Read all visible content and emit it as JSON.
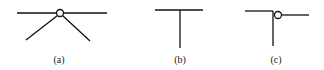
{
  "figures": [
    {
      "id": "a",
      "label": "(a)",
      "description": "horizontal line with hinge circle at center and two diagonal legs"
    },
    {
      "id": "b",
      "label": "(b)",
      "description": "T-junction: horizontal line with vertical stem"
    },
    {
      "id": "c",
      "label": "(c)",
      "description": "corner junction with hinge circle connecting to offset horizontal line"
    }
  ],
  "colors": {
    "stroke": "#111111",
    "background": "#ffffff"
  }
}
